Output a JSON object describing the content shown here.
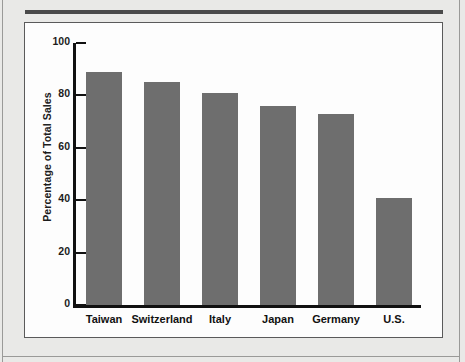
{
  "chart_data": {
    "type": "bar",
    "title": "",
    "xlabel": "",
    "ylabel": "Percentage of Total Sales",
    "categories": [
      "Taiwan",
      "Switzerland",
      "Italy",
      "Japan",
      "Germany",
      "U.S."
    ],
    "values": [
      89,
      85,
      81,
      76,
      73,
      41
    ],
    "ylim": [
      0,
      100
    ],
    "yticks": [
      0,
      20,
      40,
      60,
      80,
      100
    ],
    "ytick_labels": [
      "0",
      "20",
      "40",
      "60",
      "80",
      "100"
    ],
    "grid": false,
    "legend": null,
    "bar_color": "#6e6e6e",
    "axis_color": "#111111",
    "panel_background": "#fdfdfd",
    "page_background": "#e9e9e7"
  },
  "figure": {
    "panel_border_color": "#5a5a5a",
    "top_rule_color": "#4a4a4a"
  }
}
